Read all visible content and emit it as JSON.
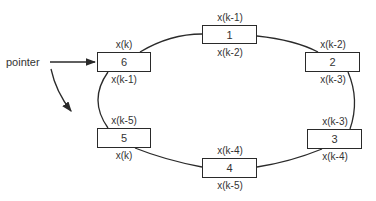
{
  "diagram": {
    "pointer_label": "pointer",
    "nodes": [
      {
        "id": "1",
        "top_label": "x(k-1)",
        "bottom_label": "x(k-2)"
      },
      {
        "id": "2",
        "top_label": "x(k-2)",
        "bottom_label": "x(k-3)"
      },
      {
        "id": "3",
        "top_label": "x(k-3)",
        "bottom_label": "x(k-4)"
      },
      {
        "id": "4",
        "top_label": "x(k-4)",
        "bottom_label": "x(k-5)"
      },
      {
        "id": "5",
        "top_label": "x(k-5)",
        "bottom_label": "x(k)"
      },
      {
        "id": "6",
        "top_label": "x(k)",
        "bottom_label": "x(k-1)"
      }
    ],
    "colors": {
      "line": "#2a2a2a",
      "text": "#333333",
      "background": "#ffffff"
    }
  }
}
